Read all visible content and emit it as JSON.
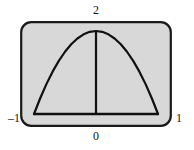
{
  "figure": {
    "name": "parabola-plot",
    "background_color": "#ffffff",
    "frame": {
      "fill_color": "#d8d8d8",
      "border_color": "#1a1a1a",
      "corner_radius": 10,
      "border_width": 2
    },
    "curve": {
      "color": "#111111",
      "width": 2.2
    }
  },
  "labels": {
    "top": "2",
    "bottom": "0",
    "left": "–1",
    "right": "1"
  },
  "chart_data": {
    "type": "line",
    "title": "",
    "xlabel": "",
    "ylabel": "",
    "xlim": [
      -1,
      1
    ],
    "ylim": [
      0,
      2
    ],
    "grid": false,
    "legend": "none",
    "xticks": [
      -1,
      0,
      1
    ],
    "xticklabels": [
      "–1",
      "0",
      "1"
    ],
    "yticks": [
      2
    ],
    "yticklabels": [
      "2"
    ],
    "annotations": [
      {
        "text": "2",
        "position": "top-center",
        "meaning": "peak value of curve at x = 0"
      },
      {
        "text": "0",
        "position": "bottom-center",
        "meaning": "origin / x = 0"
      },
      {
        "text": "–1",
        "position": "bottom-left",
        "meaning": "left endpoint x = –1"
      },
      {
        "text": "1",
        "position": "bottom-right",
        "meaning": "right endpoint x = 1"
      }
    ],
    "series": [
      {
        "name": "parabola",
        "equation": "y = 2(1 - x^2)",
        "x": [
          -1,
          -0.9,
          -0.8,
          -0.7,
          -0.6,
          -0.5,
          -0.4,
          -0.3,
          -0.2,
          -0.1,
          0,
          0.1,
          0.2,
          0.3,
          0.4,
          0.5,
          0.6,
          0.7,
          0.8,
          0.9,
          1
        ],
        "values": [
          0,
          0.38,
          0.72,
          1.02,
          1.28,
          1.5,
          1.68,
          1.82,
          1.92,
          1.98,
          2,
          1.98,
          1.92,
          1.82,
          1.68,
          1.5,
          1.28,
          1.02,
          0.72,
          0.38,
          0
        ]
      },
      {
        "name": "baseline",
        "equation": "y = 0",
        "x": [
          -1,
          1
        ],
        "values": [
          0,
          0
        ]
      },
      {
        "name": "vertical-axis-segment",
        "equation": "x = 0",
        "x": [
          0,
          0
        ],
        "values": [
          0,
          2
        ]
      }
    ]
  }
}
